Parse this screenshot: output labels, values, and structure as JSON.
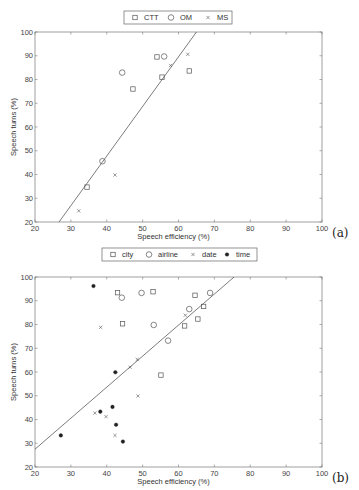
{
  "chart_data": [
    {
      "type": "scatter",
      "panel_label": "(a)",
      "title": "",
      "xlabel": "Speech efficiency (%)",
      "ylabel": "Speech turns (%)",
      "xlim": [
        20,
        100
      ],
      "ylim": [
        20,
        100
      ],
      "xticks": [
        20,
        30,
        40,
        50,
        60,
        70,
        80,
        90,
        100
      ],
      "yticks": [
        20,
        30,
        40,
        50,
        60,
        70,
        80,
        90,
        100
      ],
      "grid": false,
      "legend_position": "top-center",
      "series": [
        {
          "name": "CTT",
          "marker": "square",
          "points": [
            [
              54,
              89.5
            ],
            [
              63,
              83.6
            ],
            [
              55.4,
              81
            ],
            [
              47.3,
              76
            ],
            [
              34.5,
              34.7
            ]
          ]
        },
        {
          "name": "OM",
          "marker": "circle",
          "points": [
            [
              56,
              89.7
            ],
            [
              44.3,
              82.9
            ],
            [
              38.8,
              45.6
            ]
          ]
        },
        {
          "name": "MS",
          "marker": "x",
          "points": [
            [
              62.6,
              90.6
            ],
            [
              57.8,
              85.9
            ],
            [
              42.3,
              39.8
            ],
            [
              32.2,
              24.7
            ]
          ]
        }
      ],
      "fit_line": {
        "from": [
          26.7,
          20
        ],
        "to": [
          65,
          100
        ]
      }
    },
    {
      "type": "scatter",
      "panel_label": "(b)",
      "title": "",
      "xlabel": "Speech efficiency (%)",
      "ylabel": "Speech turns (%)",
      "xlim": [
        20,
        100
      ],
      "ylim": [
        20,
        100
      ],
      "xticks": [
        20,
        30,
        40,
        50,
        60,
        70,
        80,
        90,
        100
      ],
      "yticks": [
        20,
        30,
        40,
        50,
        60,
        70,
        80,
        90,
        100
      ],
      "grid": false,
      "legend_position": "top-center",
      "series": [
        {
          "name": "city",
          "marker": "square",
          "points": [
            [
              43,
              93.4
            ],
            [
              52.9,
              93.8
            ],
            [
              64.6,
              92.3
            ],
            [
              67,
              87.6
            ],
            [
              65.4,
              82.3
            ],
            [
              61.7,
              79.4
            ],
            [
              44.4,
              80.3
            ],
            [
              55.1,
              58.7
            ]
          ]
        },
        {
          "name": "airline",
          "marker": "circle",
          "points": [
            [
              44.2,
              91.3
            ],
            [
              49.7,
              93.3
            ],
            [
              68.8,
              93.3
            ],
            [
              63,
              86.5
            ],
            [
              53.1,
              79.8
            ],
            [
              57.1,
              73.2
            ]
          ]
        },
        {
          "name": "date",
          "marker": "x",
          "points": [
            [
              38.3,
              78.8
            ],
            [
              61.9,
              83.9
            ],
            [
              48.5,
              65.3
            ],
            [
              46.5,
              62
            ],
            [
              48.7,
              49.9
            ],
            [
              36.7,
              42.7
            ],
            [
              39.8,
              41.2
            ],
            [
              42.3,
              33.3
            ]
          ]
        },
        {
          "name": "time",
          "marker": "filled-dot",
          "points": [
            [
              36.3,
              96.2
            ],
            [
              42.4,
              59.9
            ],
            [
              41.6,
              45.3
            ],
            [
              38.2,
              43.3
            ],
            [
              42.6,
              37.8
            ],
            [
              27.2,
              33.3
            ],
            [
              44.5,
              30.7
            ]
          ]
        }
      ],
      "fit_line": {
        "from": [
          20,
          27.5
        ],
        "to": [
          75.5,
          100
        ]
      }
    }
  ]
}
